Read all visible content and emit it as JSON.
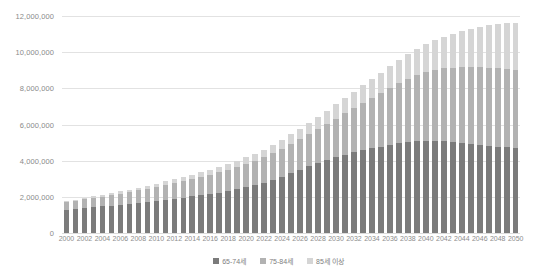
{
  "chart_data": {
    "type": "bar",
    "stacked": true,
    "title": "",
    "subtitle": "",
    "xlabel": "",
    "ylabel": "",
    "ylim": [
      0,
      12000000
    ],
    "yticks": [
      0,
      2000000,
      4000000,
      6000000,
      8000000,
      10000000,
      12000000
    ],
    "ytick_labels": [
      "0",
      "2,000,000",
      "4,000,000",
      "6,000,000",
      "8,000,000",
      "10,000,000",
      "12,000,000"
    ],
    "grid": true,
    "legend_position": "bottom",
    "categories": [
      "2000",
      "2001",
      "2002",
      "2003",
      "2004",
      "2005",
      "2006",
      "2007",
      "2008",
      "2009",
      "2010",
      "2011",
      "2012",
      "2013",
      "2014",
      "2015",
      "2016",
      "2017",
      "2018",
      "2019",
      "2020",
      "2021",
      "2022",
      "2023",
      "2024",
      "2025",
      "2026",
      "2027",
      "2028",
      "2029",
      "2030",
      "2031",
      "2032",
      "2033",
      "2034",
      "2035",
      "2036",
      "2037",
      "2038",
      "2039",
      "2040",
      "2041",
      "2042",
      "2043",
      "2044",
      "2045",
      "2046",
      "2047",
      "2048",
      "2049",
      "2050"
    ],
    "xtick_labels": [
      "2000",
      "2002",
      "2004",
      "2006",
      "2008",
      "2010",
      "2012",
      "2014",
      "2016",
      "2018",
      "2020",
      "2022",
      "2024",
      "2026",
      "2028",
      "2030",
      "2032",
      "2034",
      "2036",
      "2038",
      "2040",
      "2042",
      "2044",
      "2046",
      "2048",
      "2050"
    ],
    "series": [
      {
        "name": "65-74세",
        "color": "#7b7b7b",
        "values": [
          1280000,
          1330000,
          1390000,
          1440000,
          1470000,
          1520000,
          1570000,
          1620000,
          1680000,
          1730000,
          1790000,
          1840000,
          1900000,
          1960000,
          2020000,
          2080000,
          2150000,
          2230000,
          2320000,
          2420000,
          2530000,
          2650000,
          2780000,
          2930000,
          3100000,
          3300000,
          3500000,
          3700000,
          3880000,
          4050000,
          4200000,
          4340000,
          4470000,
          4580000,
          4680000,
          4780000,
          4880000,
          4960000,
          5030000,
          5080000,
          5110000,
          5110000,
          5090000,
          5050000,
          5000000,
          4950000,
          4890000,
          4830000,
          4780000,
          4730000,
          4690000
        ]
      },
      {
        "name": "75-84세",
        "color": "#b2b2b2",
        "values": [
          420000,
          440000,
          470000,
          500000,
          530000,
          570000,
          610000,
          650000,
          690000,
          730000,
          780000,
          830000,
          880000,
          930000,
          980000,
          1030000,
          1080000,
          1130000,
          1180000,
          1230000,
          1290000,
          1350000,
          1410000,
          1480000,
          1550000,
          1620000,
          1700000,
          1790000,
          1890000,
          2000000,
          2130000,
          2280000,
          2440000,
          2610000,
          2790000,
          2970000,
          3150000,
          3330000,
          3500000,
          3650000,
          3790000,
          3910000,
          4010000,
          4100000,
          4170000,
          4230000,
          4280000,
          4310000,
          4330000,
          4340000,
          4340000
        ]
      },
      {
        "name": "85세 이상",
        "color": "#d5d5d5",
        "values": [
          70000,
          75000,
          82000,
          90000,
          98000,
          108000,
          118000,
          128000,
          140000,
          152000,
          165000,
          180000,
          195000,
          210000,
          228000,
          246000,
          266000,
          288000,
          312000,
          338000,
          366000,
          396000,
          428000,
          462000,
          498000,
          536000,
          578000,
          622000,
          670000,
          722000,
          778000,
          838000,
          902000,
          970000,
          1042000,
          1118000,
          1198000,
          1282000,
          1370000,
          1462000,
          1558000,
          1658000,
          1762000,
          1870000,
          1982000,
          2098000,
          2218000,
          2342000,
          2470000,
          2560000,
          2600000
        ]
      }
    ]
  }
}
